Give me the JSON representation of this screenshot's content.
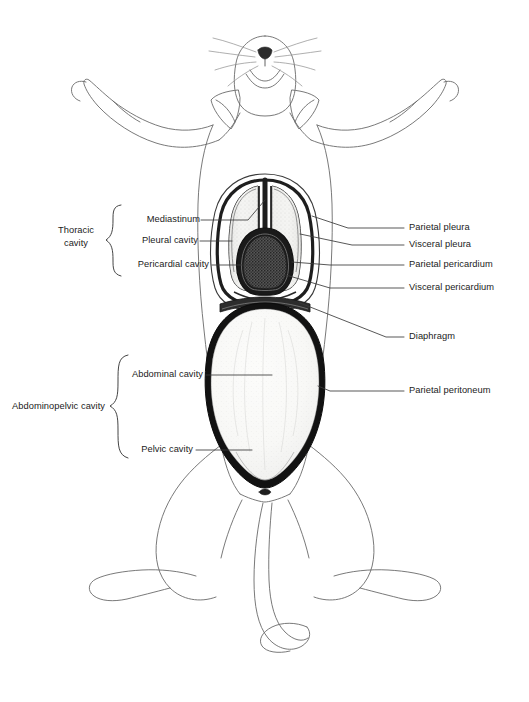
{
  "figure": {
    "view": "ventral",
    "background_color": "#ffffff",
    "ink_color": "#1b1b1b",
    "outline_color": "#555555"
  },
  "groups": [
    {
      "id": "thoracic",
      "label": "Thoracic\ncavity",
      "label_line1": "Thoracic",
      "label_line2": "cavity",
      "members": [
        "Mediastinum",
        "Pleural cavity",
        "Pericardial cavity"
      ]
    },
    {
      "id": "abdominopelvic",
      "label": "Abdominopelvic cavity",
      "label_line1": "Abdominopelvic cavity",
      "label_line2": "",
      "members": [
        "Abdominal cavity",
        "Pelvic cavity"
      ]
    }
  ],
  "labels_left": [
    {
      "id": "mediastinum",
      "text": "Mediastinum"
    },
    {
      "id": "pleural-cavity",
      "text": "Pleural cavity"
    },
    {
      "id": "pericardial-cavity",
      "text": "Pericardial cavity"
    },
    {
      "id": "abdominal-cavity",
      "text": "Abdominal cavity"
    },
    {
      "id": "pelvic-cavity",
      "text": "Pelvic cavity"
    }
  ],
  "labels_right": [
    {
      "id": "parietal-pleura",
      "text": "Parietal pleura"
    },
    {
      "id": "visceral-pleura",
      "text": "Visceral pleura"
    },
    {
      "id": "parietal-pericardium",
      "text": "Parietal pericardium"
    },
    {
      "id": "visceral-pericardium",
      "text": "Visceral pericardium"
    },
    {
      "id": "diaphragm",
      "text": "Diaphragm"
    },
    {
      "id": "parietal-peritoneum",
      "text": "Parietal peritoneum"
    }
  ],
  "anatomy_regions": [
    {
      "id": "pleural-cavity-left",
      "fill": "#f2f2f0",
      "description": "left pleural cavity, light stippled"
    },
    {
      "id": "pleural-cavity-right",
      "fill": "#f2f2f0",
      "description": "right pleural cavity, light stippled"
    },
    {
      "id": "pericardial-cavity",
      "fill": "#4a4a4a",
      "description": "pericardial cavity, dark granular"
    },
    {
      "id": "abdominal-cavity",
      "fill": "#f7f7f5",
      "description": "abdominal cavity, large light oval"
    },
    {
      "id": "diaphragm",
      "fill": "#2a2a2a",
      "description": "diaphragm band"
    },
    {
      "id": "parietal-peritoneum",
      "fill": "#1a1a1a",
      "description": "dark peritoneum border"
    }
  ]
}
